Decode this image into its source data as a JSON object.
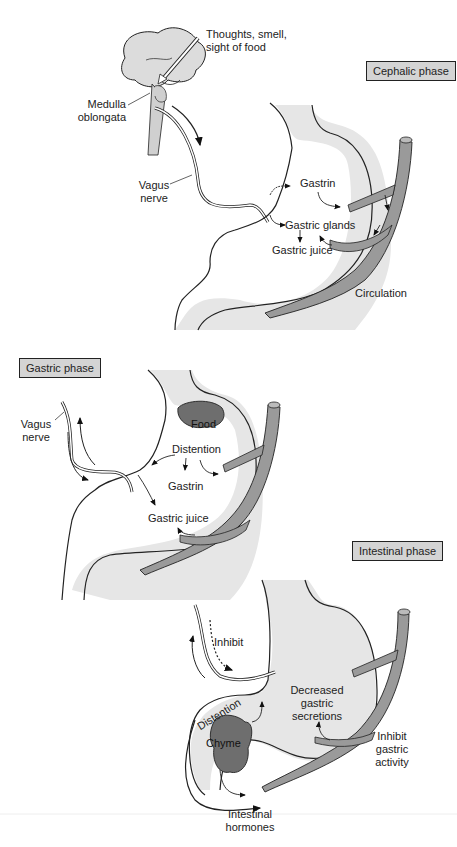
{
  "colors": {
    "stomach_fill": "#e6e6e6",
    "vessel_fill": "#9a9a9a",
    "food_fill": "#6e6e6e",
    "phase_box_fill": "#d4d4d4",
    "outline": "#222222"
  },
  "cephalic": {
    "phase_label": "Cephalic phase",
    "stimulus": [
      "Thoughts, smell,",
      "sight of food"
    ],
    "medulla": [
      "Medulla",
      "oblongata"
    ],
    "vagus": [
      "Vagus",
      "nerve"
    ],
    "gastrin": "Gastrin",
    "glands": "Gastric glands",
    "juice": "Gastric juice",
    "circulation": "Circulation"
  },
  "gastric": {
    "phase_label": "Gastric phase",
    "vagus": [
      "Vagus",
      "nerve"
    ],
    "food": "Food",
    "distention": "Distention",
    "gastrin": "Gastrin",
    "juice": "Gastric juice"
  },
  "intestinal": {
    "phase_label": "Intestinal phase",
    "inhibit": "Inhibit",
    "distention": "Distention",
    "chyme": "Chyme",
    "decreased": [
      "Decreased",
      "gastric",
      "secretions"
    ],
    "inhibit_activity": [
      "Inhibit",
      "gastric",
      "activity"
    ],
    "hormones": [
      "Intestinal",
      "hormones"
    ]
  }
}
